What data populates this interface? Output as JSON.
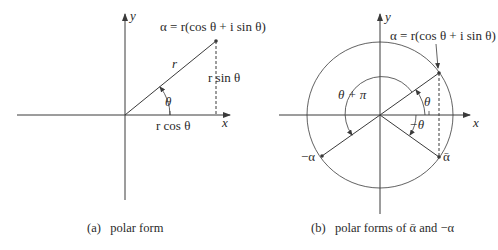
{
  "figure_a": {
    "caption": "(a)   polar form",
    "axis_x_label": "x",
    "axis_y_label": "y",
    "point_label": "α = r(cos θ + i sin θ)",
    "radius_label": "r",
    "angle_label": "θ",
    "horizontal_label": "r cos θ",
    "vertical_label": "r sin θ"
  },
  "figure_b": {
    "caption": "(b)   polar forms of ᾱ and −α",
    "axis_x_label": "x",
    "axis_y_label": "y",
    "point_label": "α = r(cos θ + i sin θ)",
    "angle_theta_label": "θ",
    "angle_neg_theta_label": "−θ",
    "angle_theta_pi_label": "θ + π",
    "conjugate_label": "ᾱ",
    "negative_label": "−α"
  },
  "colors": {
    "line": "#3a3a3a",
    "text": "#2a2a2a",
    "background": "#ffffff"
  }
}
